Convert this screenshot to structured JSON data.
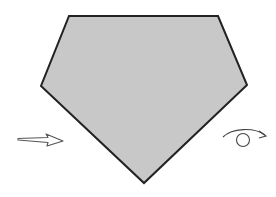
{
  "diagram": {
    "shape": {
      "type": "pentagon",
      "fill": "#c8c8c8",
      "stroke": "#222222",
      "points": [
        [
          69,
          16
        ],
        [
          218,
          16
        ],
        [
          247,
          85
        ],
        [
          144,
          183
        ],
        [
          41,
          86
        ]
      ]
    },
    "arrow": {
      "direction": "right",
      "icon": "arrow-right-icon",
      "stroke": "#555555"
    },
    "rotation": {
      "icon": "rotate-clockwise-icon",
      "stroke": "#444444"
    }
  }
}
